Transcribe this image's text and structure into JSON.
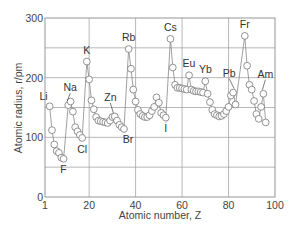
{
  "chart_data": {
    "type": "line",
    "title": "",
    "xlabel": "Atomic number, Z",
    "ylabel": "Atomic radius, r/pm",
    "xlim": [
      1,
      100
    ],
    "ylim": [
      0,
      300
    ],
    "grid": true,
    "legend": null,
    "x_ticks": [
      {
        "value": 1,
        "label": "1"
      },
      {
        "value": 20,
        "label": "20"
      },
      {
        "value": 40,
        "label": "40"
      },
      {
        "value": 60,
        "label": "60"
      },
      {
        "value": 80,
        "label": "80"
      },
      {
        "value": 100,
        "label": "100"
      }
    ],
    "y_ticks": [
      {
        "value": 0,
        "label": "0"
      },
      {
        "value": 100,
        "label": "100"
      },
      {
        "value": 200,
        "label": "200"
      },
      {
        "value": 300,
        "label": "300"
      }
    ],
    "x_gridlines": [
      20,
      40,
      60,
      80
    ],
    "y_gridlines": [
      50,
      100,
      150,
      200,
      250
    ],
    "series": [
      {
        "name": "Atomic radius",
        "marker": "open-circle",
        "points": [
          [
            3,
            152
          ],
          [
            4,
            112
          ],
          [
            5,
            88
          ],
          [
            6,
            77
          ],
          [
            7,
            74
          ],
          [
            8,
            66
          ],
          [
            9,
            64
          ],
          [
            11,
            154
          ],
          [
            12,
            160
          ],
          [
            13,
            143
          ],
          [
            14,
            117
          ],
          [
            15,
            110
          ],
          [
            16,
            104
          ],
          [
            17,
            99
          ],
          [
            19,
            227
          ],
          [
            20,
            197
          ],
          [
            21,
            162
          ],
          [
            22,
            147
          ],
          [
            23,
            134
          ],
          [
            24,
            128
          ],
          [
            25,
            127
          ],
          [
            26,
            126
          ],
          [
            27,
            125
          ],
          [
            28,
            124
          ],
          [
            29,
            128
          ],
          [
            30,
            134
          ],
          [
            31,
            135
          ],
          [
            32,
            128
          ],
          [
            33,
            121
          ],
          [
            34,
            117
          ],
          [
            35,
            114
          ],
          [
            37,
            248
          ],
          [
            38,
            215
          ],
          [
            39,
            180
          ],
          [
            40,
            160
          ],
          [
            41,
            146
          ],
          [
            42,
            139
          ],
          [
            43,
            136
          ],
          [
            44,
            134
          ],
          [
            45,
            134
          ],
          [
            46,
            137
          ],
          [
            47,
            144
          ],
          [
            48,
            151
          ],
          [
            49,
            167
          ],
          [
            50,
            158
          ],
          [
            51,
            141
          ],
          [
            52,
            137
          ],
          [
            53,
            133
          ],
          [
            55,
            265
          ],
          [
            56,
            217
          ],
          [
            57,
            188
          ],
          [
            58,
            183
          ],
          [
            59,
            183
          ],
          [
            60,
            182
          ],
          [
            61,
            181
          ],
          [
            62,
            180
          ],
          [
            63,
            204
          ],
          [
            64,
            180
          ],
          [
            65,
            178
          ],
          [
            66,
            177
          ],
          [
            67,
            177
          ],
          [
            68,
            176
          ],
          [
            69,
            175
          ],
          [
            70,
            194
          ],
          [
            71,
            173
          ],
          [
            72,
            159
          ],
          [
            73,
            146
          ],
          [
            74,
            139
          ],
          [
            75,
            137
          ],
          [
            76,
            135
          ],
          [
            77,
            136
          ],
          [
            78,
            139
          ],
          [
            79,
            144
          ],
          [
            80,
            151
          ],
          [
            81,
            170
          ],
          [
            82,
            175
          ],
          [
            83,
            155
          ],
          [
            87,
            270
          ],
          [
            88,
            220
          ],
          [
            89,
            188
          ],
          [
            90,
            180
          ],
          [
            91,
            161
          ],
          [
            92,
            139
          ],
          [
            93,
            131
          ],
          [
            94,
            151
          ],
          [
            95,
            173
          ],
          [
            96,
            125
          ]
        ]
      }
    ],
    "annotations": [
      {
        "text": "Li",
        "z": 3,
        "r": 152,
        "dx": -2,
        "dy": -6,
        "anchor": "end",
        "leader": false
      },
      {
        "text": "Na",
        "z": 11,
        "r": 154,
        "dx": 2,
        "dy": -14,
        "anchor": "middle",
        "leader": true
      },
      {
        "text": "F",
        "z": 9,
        "r": 64,
        "dx": 0,
        "dy": 14,
        "anchor": "middle",
        "leader": false
      },
      {
        "text": "Cl",
        "z": 17,
        "r": 99,
        "dx": 0,
        "dy": 15,
        "anchor": "middle",
        "leader": false
      },
      {
        "text": "K",
        "z": 19,
        "r": 227,
        "dx": 0,
        "dy": -8,
        "anchor": "middle",
        "leader": false
      },
      {
        "text": "Zn",
        "z": 30,
        "r": 134,
        "dx": -2,
        "dy": -16,
        "anchor": "middle",
        "leader": true
      },
      {
        "text": "Br",
        "z": 35,
        "r": 114,
        "dx": 4,
        "dy": 14,
        "anchor": "middle",
        "leader": false
      },
      {
        "text": "Rb",
        "z": 37,
        "r": 248,
        "dx": 0,
        "dy": -8,
        "anchor": "middle",
        "leader": false
      },
      {
        "text": "I",
        "z": 53,
        "r": 133,
        "dx": 0,
        "dy": 14,
        "anchor": "middle",
        "leader": true
      },
      {
        "text": "Cs",
        "z": 55,
        "r": 265,
        "dx": 0,
        "dy": -8,
        "anchor": "middle",
        "leader": false
      },
      {
        "text": "Eu",
        "z": 63,
        "r": 204,
        "dx": 0,
        "dy": -8,
        "anchor": "middle",
        "leader": false
      },
      {
        "text": "Yb",
        "z": 70,
        "r": 194,
        "dx": 0,
        "dy": -8,
        "anchor": "middle",
        "leader": false
      },
      {
        "text": "Pb",
        "z": 82,
        "r": 175,
        "dx": -4,
        "dy": -16,
        "anchor": "middle",
        "leader": true
      },
      {
        "text": "Fr",
        "z": 87,
        "r": 270,
        "dx": 0,
        "dy": -8,
        "anchor": "middle",
        "leader": false
      },
      {
        "text": "Am",
        "z": 95,
        "r": 173,
        "dx": 2,
        "dy": -16,
        "anchor": "middle",
        "leader": true
      }
    ]
  },
  "layout": {
    "plot": {
      "x0": 45,
      "x1": 275,
      "y0": 197,
      "y1": 18
    },
    "colors": {
      "line": "#777777",
      "grid": "#9a9a9a",
      "text": "#444444",
      "background": "#ffffff"
    }
  }
}
